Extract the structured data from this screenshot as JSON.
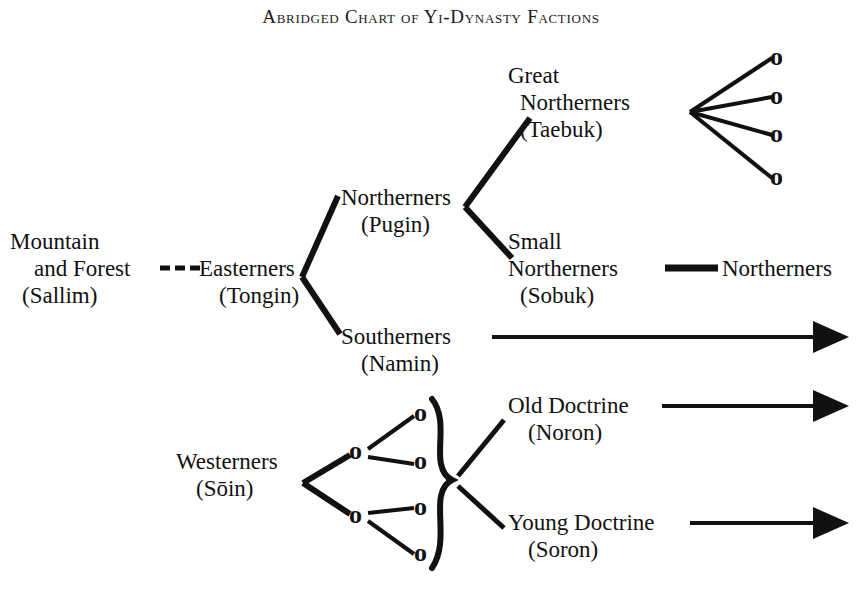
{
  "title": "Abridged Chart of Yi-Dynasty Factions",
  "colors": {
    "ink": "#111111",
    "background": "#ffffff"
  },
  "nodes": {
    "sallim": {
      "line1": "Mountain",
      "line2": "and Forest",
      "romanization": "(Sallim)"
    },
    "tongin": {
      "line1": "Easterners",
      "romanization": "(Tongin)"
    },
    "pugin": {
      "line1": "Northerners",
      "romanization": "(Pugin)"
    },
    "taebuk": {
      "line1": "Great",
      "line2": "Northerners",
      "romanization": "(Taebuk)"
    },
    "sobuk": {
      "line1": "Small",
      "line2": "Northerners",
      "romanization": "(Sobuk)"
    },
    "northerners_terminal": {
      "line1": "Northerners"
    },
    "namin": {
      "line1": "Southerners",
      "romanization": "(Namin)"
    },
    "soin": {
      "line1": "Westerners",
      "romanization": "(Sōin)"
    },
    "noron": {
      "line1": "Old Doctrine",
      "romanization": "(Noron)"
    },
    "soron": {
      "line1": "Young Doctrine",
      "romanization": "(Soron)"
    }
  },
  "markers": {
    "circle_node_glyph": "o",
    "taebuk_branch_count": 4,
    "westerner_tier1_count": 2,
    "westerner_tier2_count": 4
  },
  "connectors": [
    {
      "name": "sallim-to-tongin",
      "style": "dashed"
    },
    {
      "name": "tongin-to-pugin",
      "style": "line"
    },
    {
      "name": "tongin-to-namin",
      "style": "line"
    },
    {
      "name": "pugin-to-taebuk",
      "style": "line"
    },
    {
      "name": "pugin-to-sobuk",
      "style": "line"
    },
    {
      "name": "taebuk-fan",
      "style": "line"
    },
    {
      "name": "sobuk-to-northerners",
      "style": "line"
    },
    {
      "name": "namin-arrow",
      "style": "arrow"
    },
    {
      "name": "soin-fan",
      "style": "line"
    },
    {
      "name": "brace-to-noron",
      "style": "line"
    },
    {
      "name": "brace-to-soron",
      "style": "line"
    },
    {
      "name": "noron-arrow",
      "style": "arrow"
    },
    {
      "name": "soron-arrow",
      "style": "arrow"
    }
  ]
}
